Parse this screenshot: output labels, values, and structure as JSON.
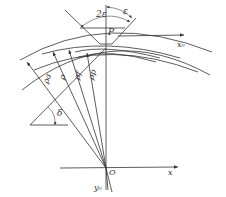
{
  "diagram": {
    "type": "geometry",
    "labels": {
      "two_epsilon": "2ε",
      "epsilon": "ε",
      "point_p": "P",
      "x0_axis": "x₀",
      "rho_a": "ρa",
      "rho": "ρ",
      "rho_f": "ρf",
      "rho_p": "ρp",
      "delta": "δ",
      "origin": "O",
      "x_axis": "x",
      "y0_axis": "y₀"
    },
    "colors": {
      "line": "#333333",
      "background": "#ffffff"
    }
  }
}
